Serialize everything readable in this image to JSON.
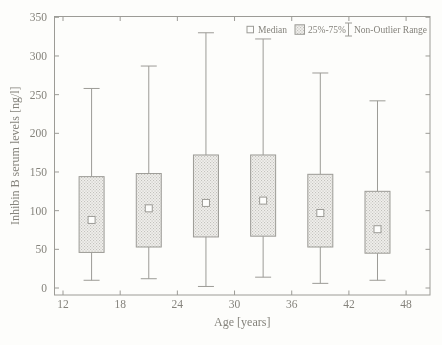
{
  "chart_data": {
    "type": "boxplot",
    "title": "",
    "xlabel": "Age [years]",
    "ylabel": "Inhibin B serum levels [ng/l]",
    "x_ticks": [
      12,
      18,
      24,
      30,
      36,
      42,
      48
    ],
    "y_ticks": [
      0,
      50,
      100,
      150,
      200,
      250,
      300,
      350
    ],
    "xlim": [
      11,
      50.5
    ],
    "ylim": [
      -9,
      351
    ],
    "grid": false,
    "legend_position": "top-right-inside",
    "legend": [
      {
        "glyph": "median-square",
        "label": "Median"
      },
      {
        "glyph": "box-pattern",
        "label": "25%-75%"
      },
      {
        "glyph": "whisker-bar",
        "label": "Non-Outlier Range"
      }
    ],
    "series": [
      {
        "x": 15,
        "min": 10,
        "q1": 46,
        "median": 88,
        "q3": 144,
        "max": 258
      },
      {
        "x": 21,
        "min": 12,
        "q1": 53,
        "median": 103,
        "q3": 148,
        "max": 287
      },
      {
        "x": 27,
        "min": 2,
        "q1": 66,
        "median": 110,
        "q3": 172,
        "max": 330
      },
      {
        "x": 33,
        "min": 14,
        "q1": 67,
        "median": 113,
        "q3": 172,
        "max": 322
      },
      {
        "x": 39,
        "min": 6,
        "q1": 53,
        "median": 97,
        "q3": 147,
        "max": 278
      },
      {
        "x": 45,
        "min": 10,
        "q1": 45,
        "median": 76,
        "q3": 125,
        "max": 242
      }
    ],
    "colors": {
      "background": "#fdfdfb",
      "line": "#9c9b96",
      "text": "#85837c",
      "box_fill": "#f0efec",
      "box_dot": "#c3c2bd",
      "marker_fill": "#fdfdfb"
    }
  }
}
